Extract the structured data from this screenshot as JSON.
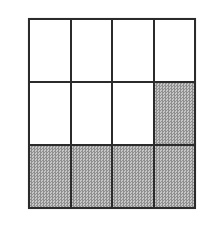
{
  "diagram": {
    "type": "rectangular-fraction-grid",
    "rows": 3,
    "columns": 4,
    "total_cells": 12,
    "shaded_count": 5,
    "cells": [
      [
        0,
        0,
        0,
        0
      ],
      [
        0,
        0,
        0,
        1
      ],
      [
        1,
        1,
        1,
        1
      ]
    ],
    "colors": {
      "background": "#ffffff",
      "grid_line": "#2b2b2b",
      "cell_fill": "#ffffff",
      "shade_dark": "#8f8f8f",
      "shade_light": "#c6c6c6"
    }
  }
}
